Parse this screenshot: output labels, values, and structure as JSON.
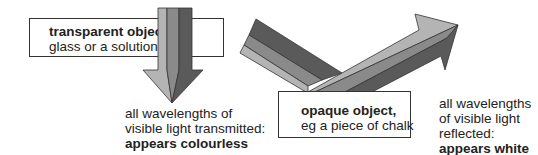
{
  "transparent": {
    "title": "transparent object,",
    "subtitle": "glass or a solution",
    "caption_lines": [
      "all wavelengths of",
      "visible light transmitted:"
    ],
    "caption_bold": "appears colourless"
  },
  "opaque": {
    "title": "opaque object,",
    "subtitle": "eg a piece of chalk",
    "caption_lines": [
      "all wavelengths",
      "of visible light",
      "reflected:"
    ],
    "caption_bold": "appears white"
  },
  "colors": {
    "light": "#b4b4b4",
    "mid": "#8a8a8a",
    "dark": "#5a5a5a",
    "outline": "#333333"
  }
}
